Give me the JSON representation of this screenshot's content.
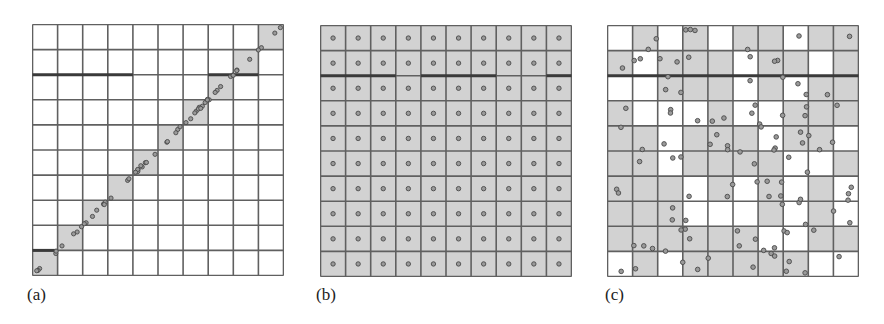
{
  "figure": {
    "grid_size": 10,
    "colors": {
      "shade": "#d2d2d2",
      "line": "#606060",
      "thick_line": "#3a3a3a",
      "circle_fill": "#9a9a9a",
      "circle_stroke": "#4a4a4a",
      "background": "#ffffff"
    },
    "panels": [
      {
        "id": "a",
        "label": "(a)",
        "description": "Anti-diagonal shaded cells with points clustered along the diagonal",
        "box": {
          "x": 32,
          "y": 24,
          "size": 251
        },
        "shaded": [
          [
            0,
            0,
            0,
            0,
            0,
            0,
            0,
            0,
            0,
            1
          ],
          [
            0,
            0,
            0,
            0,
            0,
            0,
            0,
            0,
            1,
            0
          ],
          [
            0,
            0,
            0,
            0,
            0,
            0,
            0,
            1,
            0,
            0
          ],
          [
            0,
            0,
            0,
            0,
            0,
            0,
            1,
            0,
            0,
            0
          ],
          [
            0,
            0,
            0,
            0,
            0,
            1,
            0,
            0,
            0,
            0
          ],
          [
            0,
            0,
            0,
            0,
            1,
            0,
            0,
            0,
            0,
            0
          ],
          [
            0,
            0,
            0,
            1,
            0,
            0,
            0,
            0,
            0,
            0
          ],
          [
            0,
            0,
            1,
            0,
            0,
            0,
            0,
            0,
            0,
            0
          ],
          [
            0,
            1,
            0,
            0,
            0,
            0,
            0,
            0,
            0,
            0
          ],
          [
            1,
            0,
            0,
            0,
            0,
            0,
            0,
            0,
            0,
            0
          ]
        ],
        "thick_lines": [
          {
            "row_boundary": 2,
            "col_from": 0,
            "col_to": 4
          },
          {
            "row_boundary": 2,
            "col_from": 7,
            "col_to": 9
          },
          {
            "row_boundary": 9,
            "col_from": 0,
            "col_to": 1
          }
        ],
        "points_mode": "diagonal"
      },
      {
        "id": "b",
        "label": "(b)",
        "description": "All cells shaded, one point centered in each cell",
        "box": {
          "x": 320,
          "y": 25,
          "size": 251
        },
        "shaded": "all",
        "thick_lines": [
          {
            "row_boundary": 2,
            "col_from": 0,
            "col_to": 3
          },
          {
            "row_boundary": 2,
            "col_from": 4,
            "col_to": 7
          },
          {
            "row_boundary": 2,
            "col_from": 9,
            "col_to": 10
          }
        ],
        "points_mode": "centered"
      },
      {
        "id": "c",
        "label": "(c)",
        "description": "Random shaded cells with randomly scattered points",
        "box": {
          "x": 607,
          "y": 25,
          "size": 251
        },
        "shaded": [
          [
            0,
            1,
            0,
            1,
            0,
            1,
            1,
            0,
            1,
            1
          ],
          [
            1,
            0,
            1,
            1,
            1,
            0,
            1,
            1,
            0,
            1
          ],
          [
            0,
            0,
            1,
            1,
            1,
            0,
            1,
            0,
            1,
            1
          ],
          [
            1,
            0,
            0,
            0,
            1,
            0,
            0,
            1,
            1,
            1
          ],
          [
            1,
            1,
            0,
            1,
            1,
            1,
            0,
            1,
            1,
            0
          ],
          [
            1,
            1,
            0,
            1,
            1,
            1,
            1,
            0,
            0,
            1
          ],
          [
            1,
            1,
            1,
            0,
            1,
            0,
            1,
            0,
            1,
            0
          ],
          [
            1,
            1,
            1,
            0,
            0,
            0,
            1,
            0,
            1,
            0
          ],
          [
            1,
            1,
            1,
            1,
            1,
            1,
            0,
            0,
            1,
            1
          ],
          [
            0,
            1,
            0,
            1,
            1,
            1,
            1,
            1,
            0,
            0
          ]
        ],
        "thick_lines": [
          {
            "row_boundary": 2,
            "col_from": 0,
            "col_to": 10
          }
        ],
        "points_mode": "scattered"
      }
    ]
  }
}
